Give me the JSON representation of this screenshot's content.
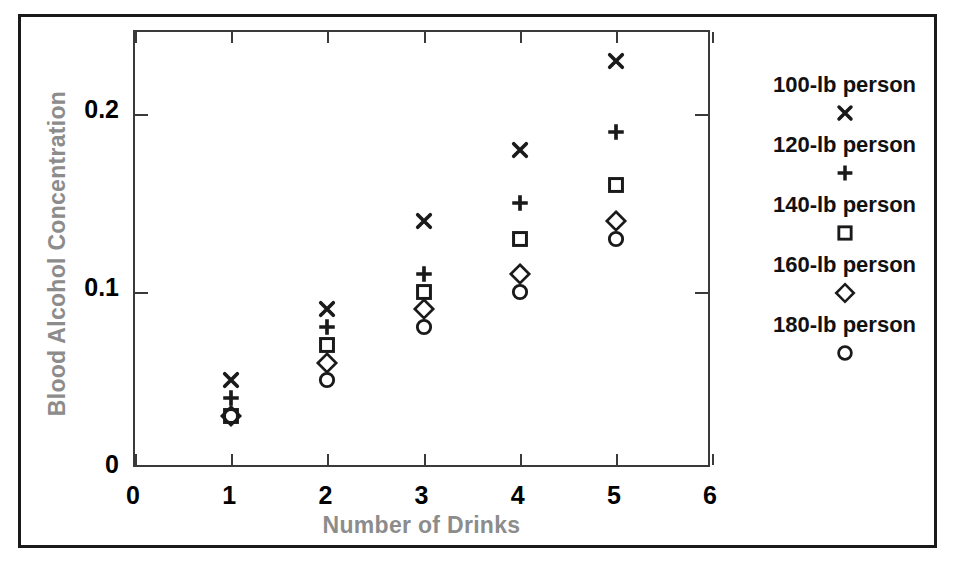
{
  "chart_data": {
    "type": "scatter",
    "title": "",
    "xlabel": "Number of Drinks",
    "ylabel": "Blood Alcohol Concentration",
    "xlim": [
      0,
      6
    ],
    "ylim": [
      0,
      0.2465
    ],
    "x": [
      1,
      2,
      3,
      4,
      5
    ],
    "xticks": [
      "0",
      "1",
      "2",
      "3",
      "4",
      "5",
      "6"
    ],
    "xtick_values": [
      0,
      1,
      2,
      3,
      4,
      5,
      6
    ],
    "yticks": [
      "0",
      "0.1",
      "0.2"
    ],
    "ytick_values": [
      0,
      0.1,
      0.2
    ],
    "grid": false,
    "legend_position": "right",
    "series": [
      {
        "name": "100-lb person",
        "marker": "cross-x",
        "values": [
          0.05,
          0.09,
          0.14,
          0.18,
          0.23
        ]
      },
      {
        "name": "120-lb person",
        "marker": "plus",
        "values": [
          0.04,
          0.08,
          0.11,
          0.15,
          0.19
        ]
      },
      {
        "name": "140-lb person",
        "marker": "square",
        "values": [
          0.03,
          0.07,
          0.1,
          0.13,
          0.16
        ]
      },
      {
        "name": "160-lb person",
        "marker": "diamond",
        "values": [
          0.03,
          0.06,
          0.09,
          0.11,
          0.14
        ]
      },
      {
        "name": "180-lb person",
        "marker": "circle",
        "values": [
          0.03,
          0.05,
          0.08,
          0.1,
          0.13
        ]
      }
    ]
  },
  "legend": {
    "entries": [
      {
        "label": "100-lb person",
        "marker": "cross-x"
      },
      {
        "label": "120-lb person",
        "marker": "plus"
      },
      {
        "label": "140-lb person",
        "marker": "square"
      },
      {
        "label": "160-lb person",
        "marker": "diamond"
      },
      {
        "label": "180-lb person",
        "marker": "circle"
      }
    ]
  },
  "colors": {
    "marker": "#1a1a1a",
    "axis_line": "#3a3a3a",
    "axis_title": "#8c8c8c",
    "tick_label": "#000000",
    "outer_frame": "#1a1a1a",
    "background": "#ffffff"
  }
}
